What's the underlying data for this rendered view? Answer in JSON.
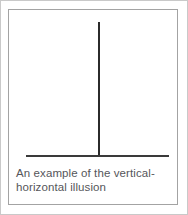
{
  "figure": {
    "caption": "An example of the vertical-\nhorizontal illusion",
    "caption_line_1": "An example of the vertical-",
    "caption_line_2": "horizontal illusion",
    "illusion_name": "vertical-horizontal illusion",
    "stimulus": {
      "shape": "inverted-T",
      "vertical_line": {
        "label": "vertical line",
        "orientation": "vertical",
        "color": "#2b2b2b"
      },
      "horizontal_line": {
        "label": "horizontal line",
        "orientation": "horizontal",
        "color": "#3a3a3a"
      }
    },
    "colors": {
      "background": "#ffffff",
      "frame_border": "#a3a3a3",
      "page_border": "#c9c9c9",
      "caption_text": "#55565a",
      "stroke": "#2b2b2b"
    }
  }
}
